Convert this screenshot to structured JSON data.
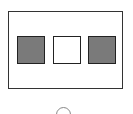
{
  "diagram": {
    "frame": {
      "label": ""
    },
    "squares": [
      {
        "fill": "#7a7a7a",
        "state": "filled"
      },
      {
        "fill": "#ffffff",
        "state": "empty"
      },
      {
        "fill": "#7a7a7a",
        "state": "filled"
      }
    ],
    "indicator": {
      "shape": "arc",
      "color": "#888888"
    }
  }
}
